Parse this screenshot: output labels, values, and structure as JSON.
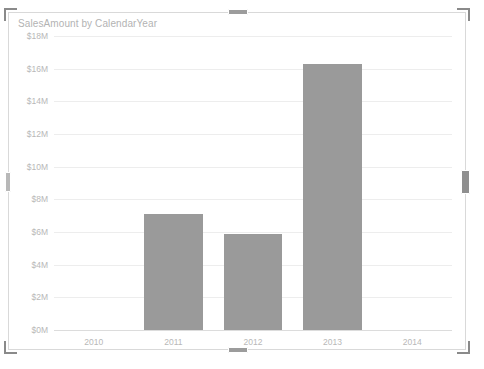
{
  "visual": {
    "title": "SalesAmount by CalendarYear",
    "selected": true,
    "bar_color": "#9a9a9a",
    "gridline_color": "#ededed",
    "axis_text_color": "#b8b8b8",
    "handles": [
      "top-left-resize-handle",
      "top-center-resize-handle",
      "top-right-resize-handle",
      "left-middle-resize-handle",
      "right-middle-resize-handle",
      "bottom-left-resize-handle",
      "bottom-center-resize-handle",
      "bottom-right-resize-handle"
    ]
  },
  "chart_data": {
    "type": "bar",
    "title": "SalesAmount by CalendarYear",
    "xlabel": "",
    "ylabel": "",
    "categories": [
      "2010",
      "2011",
      "2012",
      "2013",
      "2014"
    ],
    "values": [
      0,
      7.1,
      5.9,
      16.3,
      0
    ],
    "value_unit": "$M",
    "ylim": [
      0,
      18
    ],
    "ytick_values": [
      18,
      16,
      14,
      12,
      10,
      8,
      6,
      4,
      2,
      0
    ],
    "ytick_labels": [
      "$18M",
      "$16M",
      "$14M",
      "$12M",
      "$10M",
      "$8M",
      "$6M",
      "$4M",
      "$2M",
      "$0M"
    ],
    "grid": true,
    "legend": null,
    "series": [
      {
        "name": "SalesAmount",
        "color": "#9a9a9a",
        "values": [
          0,
          7.1,
          5.9,
          16.3,
          0
        ]
      }
    ]
  }
}
